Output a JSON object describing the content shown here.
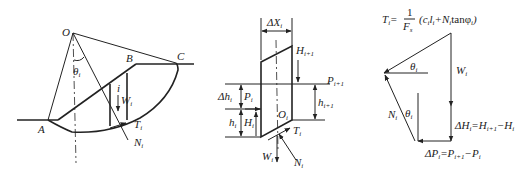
{
  "figure": {
    "panel_a": {
      "name": "slope-slice-diagram",
      "labels": {
        "O": "O",
        "A": "A",
        "B": "B",
        "C": "C",
        "theta": "θ",
        "theta_sub": "i",
        "i": "i",
        "W": "W",
        "W_sub": "i",
        "T": "T",
        "T_sub": "i",
        "N": "N",
        "N_sub": "i"
      }
    },
    "panel_b": {
      "name": "single-slice-force-diagram",
      "labels": {
        "dX": "ΔX",
        "dX_sub": "i",
        "H1": "H",
        "H1_sub": "i+1",
        "P1": "P",
        "P1_sub": "i+1",
        "h1": "h",
        "h1_sub": "i+1",
        "dh": "Δh",
        "dh_sub": "i",
        "P": "P",
        "P_sub": "i",
        "h": "h",
        "h_sub": "i",
        "H": "H",
        "H_sub": "i",
        "O": "O",
        "O_sub": "i",
        "T": "T",
        "T_sub": "i",
        "W": "W",
        "W_sub": "i",
        "N": "N",
        "N_sub": "i"
      }
    },
    "panel_c": {
      "name": "force-polygon",
      "labels": {
        "T_formula_lhs": "T",
        "T_formula_sub": "i",
        "T_formula_eq": "=",
        "T_formula_num": "1",
        "T_formula_den": "F",
        "T_formula_den_sub": "s",
        "T_formula_rhs": "(c",
        "T_formula_rhs2": "l",
        "T_formula_rhs3": "+N",
        "T_formula_rhs4": "tanφ",
        "T_formula_end": ")",
        "W": "W",
        "W_sub": "i",
        "theta1": "θ",
        "theta1_sub": "i",
        "theta2": "θ",
        "theta2_sub": "i",
        "N": "N",
        "N_sub": "i",
        "dH": "ΔH",
        "dH_sub": "i",
        "dH_eq": "=H",
        "dH_sub2": "i+1",
        "dH_minus": "−H",
        "dH_sub3": "i",
        "dP": "ΔP",
        "dP_sub": "i",
        "dP_eq": "=P",
        "dP_sub2": "i+1",
        "dP_minus": "−P",
        "dP_sub3": "i"
      }
    }
  }
}
